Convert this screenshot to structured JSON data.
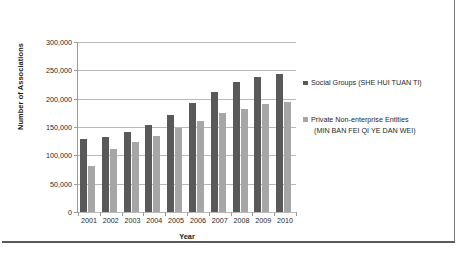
{
  "chart_data": {
    "type": "bar",
    "title": "",
    "xlabel": "Year",
    "ylabel": "Number of Associations",
    "categories": [
      "2001",
      "2002",
      "2003",
      "2004",
      "2005",
      "2006",
      "2007",
      "2008",
      "2009",
      "2010"
    ],
    "series": [
      {
        "name": "Social Groups (SHE HUI TUAN TI)",
        "color": "#595959",
        "values": [
          129000,
          133000,
          142000,
          153000,
          171000,
          192000,
          212000,
          230000,
          239000,
          243000
        ]
      },
      {
        "name": "Private Non-enterprise Entities (MIN BAN FEI QI YE DAN WEI)",
        "color": "#a6a6a6",
        "values": [
          82000,
          111000,
          124000,
          135000,
          148000,
          161000,
          174000,
          182000,
          190000,
          195000
        ]
      }
    ],
    "ylim": [
      0,
      300000
    ],
    "ytick_labels": [
      "300,000",
      "250,000",
      "200,000",
      "150,000",
      "100,000",
      "50,000",
      "0"
    ],
    "ytick_values": [
      300000,
      250000,
      200000,
      150000,
      100000,
      50000,
      0
    ],
    "grid": true,
    "legend_position": "right"
  },
  "legend": {
    "entries": [
      {
        "line1": "Social Groups (SHE HUI TUAN TI)",
        "line2": ""
      },
      {
        "line1": "Private Non-enterprise Entities",
        "line2": "(MIN BAN FEI QI YE DAN WEI)"
      }
    ]
  }
}
